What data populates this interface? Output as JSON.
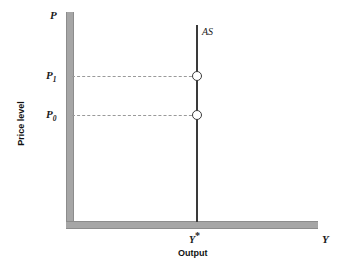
{
  "figure": {
    "axis_titles": {
      "x": "Output",
      "y": "Price level"
    },
    "axis_variables": {
      "y_top": "P",
      "x_end": "Y"
    },
    "curve_label": "AS",
    "tick_labels": {
      "p1_base": "P",
      "p1_sub": "1",
      "p0_base": "P",
      "p0_sub": "0",
      "ystar_base": "Y",
      "ystar_star": "*"
    },
    "colors": {
      "axis": "#a6a6a6",
      "curve": "#3a3a3a",
      "guide": "#9a9a9a",
      "marker_fill": "#ffffff",
      "text": "#111111"
    }
  },
  "chart_data": {
    "type": "line",
    "title": "",
    "subtitle": "",
    "xlabel": "Output",
    "ylabel": "Price level",
    "xlim": [
      0,
      1
    ],
    "ylim": [
      0,
      1
    ],
    "grid": false,
    "legend": null,
    "series": [
      {
        "name": "AS",
        "description": "Vertical long-run (classical) aggregate supply curve at full-employment output Y*",
        "x": [
          0.525,
          0.525
        ],
        "y": [
          0.0,
          0.94
        ]
      }
    ],
    "points": [
      {
        "label": "P1",
        "x": 0.525,
        "y": 0.695,
        "marker": "open-circle"
      },
      {
        "label": "P0",
        "x": 0.525,
        "y": 0.51,
        "marker": "open-circle"
      }
    ],
    "guide_lines": [
      {
        "from_axis": "y",
        "value_label": "P1",
        "y": 0.695,
        "style": "dashed",
        "to_x": 0.525
      },
      {
        "from_axis": "y",
        "value_label": "P0",
        "y": 0.51,
        "style": "dashed",
        "to_x": 0.525
      }
    ],
    "ytick_labels": [
      "P0",
      "P1"
    ],
    "xtick_labels": [
      "Y*"
    ],
    "annotations": [
      {
        "text": "AS",
        "x": 0.545,
        "y": 0.93
      },
      {
        "text": "P",
        "x": 0.0,
        "y": 1.0
      },
      {
        "text": "Y",
        "x": 1.0,
        "y": 0.0
      }
    ]
  }
}
